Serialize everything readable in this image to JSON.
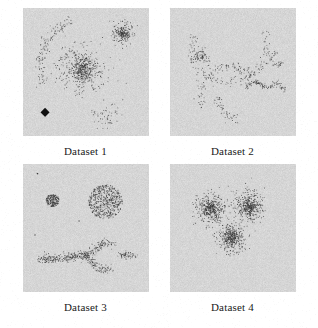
{
  "figure": {
    "title": "",
    "background_color": "#ffffff",
    "panel_background_color": "#d9d9d9",
    "point_color": "#3a3a3a",
    "caption_color": "#1a1a1a",
    "panel_width_px": 126,
    "panel_height_px": 128,
    "columns": 2,
    "rows": 2
  },
  "panels": [
    {
      "id": "dataset-1",
      "caption": "Dataset 1"
    },
    {
      "id": "dataset-2",
      "caption": "Dataset 2"
    },
    {
      "id": "dataset-3",
      "caption": "Dataset 3"
    },
    {
      "id": "dataset-4",
      "caption": "Dataset 4"
    }
  ],
  "chart_data": [
    {
      "type": "scatter",
      "title": "Dataset 1",
      "xlabel": "",
      "ylabel": "",
      "xlim": [
        0,
        1
      ],
      "ylim": [
        0,
        1
      ],
      "grid": false,
      "legend": false,
      "axes_visible": false,
      "marker": "point",
      "marker_size_px": 1.4,
      "background": "#d9d9d9",
      "description": "Dense central Gaussian blob, small dense blob upper-right, sparse scattered blob lower-right, thin crescent arc on the left, and one large solid black diamond marker at lower-left.",
      "clusters": [
        {
          "name": "central-dense-blob",
          "shape": "gaussian",
          "cx": 0.47,
          "cy": 0.52,
          "sx": 0.085,
          "sy": 0.085,
          "n": 420,
          "core_n": 140,
          "core_scale": 0.38
        },
        {
          "name": "upper-right-blob",
          "shape": "gaussian",
          "cx": 0.79,
          "cy": 0.8,
          "sx": 0.042,
          "sy": 0.04,
          "n": 170,
          "core_n": 60,
          "core_scale": 0.45
        },
        {
          "name": "lower-right-sparse-blob",
          "shape": "gaussian",
          "cx": 0.66,
          "cy": 0.17,
          "sx": 0.055,
          "sy": 0.05,
          "n": 55,
          "core_n": 0,
          "core_scale": 1
        },
        {
          "name": "left-crescent-arc",
          "shape": "arc",
          "cx": 0.5,
          "cy": 0.55,
          "r": 0.36,
          "a0": 108,
          "a1": 205,
          "thickness": 0.022,
          "n": 130
        }
      ],
      "markers": [
        {
          "name": "black-diamond",
          "shape": "diamond",
          "x": 0.175,
          "y": 0.185,
          "size": 0.072,
          "color": "#111111"
        }
      ]
    },
    {
      "type": "scatter",
      "title": "Dataset 2",
      "xlabel": "",
      "ylabel": "",
      "xlim": [
        0,
        1
      ],
      "ylim": [
        0,
        1
      ],
      "grid": false,
      "legend": false,
      "axes_visible": false,
      "marker": "point",
      "marker_size_px": 1.4,
      "background": "#d9d9d9",
      "description": "Curvilinear structures: a long S-shaped / spiral filament sweeping from upper-left down to lower-middle, a small tight spiral blob on the left, and a short zigzag filament with a detached hook on the right.",
      "clusters": [
        {
          "name": "main-spiral-upper-arc",
          "shape": "arc",
          "cx": 0.47,
          "cy": 0.72,
          "r": 0.3,
          "a0": 160,
          "a1": 380,
          "thickness": 0.022,
          "n": 150
        },
        {
          "name": "main-spiral-lower-sweep",
          "shape": "arc",
          "cx": 0.46,
          "cy": 0.33,
          "r": 0.22,
          "a0": 35,
          "a1": 215,
          "thickness": 0.022,
          "n": 110
        },
        {
          "name": "lower-tail",
          "shape": "arc",
          "cx": 0.6,
          "cy": 0.33,
          "r": 0.22,
          "a0": 185,
          "a1": 255,
          "thickness": 0.022,
          "n": 45
        },
        {
          "name": "small-spiral-blob",
          "shape": "spiral",
          "cx": 0.255,
          "cy": 0.615,
          "r0": 0.012,
          "r1": 0.055,
          "turns": 1.6,
          "thickness": 0.016,
          "n": 70
        },
        {
          "name": "right-zigzag",
          "shape": "polyline",
          "thickness": 0.018,
          "n": 110,
          "points": [
            [
              0.595,
              0.385
            ],
            [
              0.69,
              0.425
            ],
            [
              0.775,
              0.375
            ],
            [
              0.855,
              0.415
            ],
            [
              0.915,
              0.36
            ]
          ]
        },
        {
          "name": "right-hook",
          "shape": "polyline",
          "thickness": 0.016,
          "n": 35,
          "points": [
            [
              0.845,
              0.66
            ],
            [
              0.8,
              0.6
            ],
            [
              0.84,
              0.545
            ],
            [
              0.895,
              0.575
            ]
          ]
        }
      ],
      "markers": []
    },
    {
      "type": "scatter",
      "title": "Dataset 3",
      "xlabel": "",
      "ylabel": "",
      "xlim": [
        0,
        1
      ],
      "ylim": [
        0,
        1
      ],
      "grid": false,
      "legend": false,
      "axes_visible": false,
      "marker": "point",
      "marker_size_px": 1.4,
      "background": "#d9d9d9",
      "description": "Small very dense round cluster on the left, large evenly-filled uniform disk on the upper right, and a thick Y / arrow-shaped band across the lower half with a detached short bar to its right. Two isolated stray points near the top-left.",
      "clusters": [
        {
          "name": "small-dense-blob",
          "shape": "uniform-disk",
          "cx": 0.235,
          "cy": 0.715,
          "r": 0.052,
          "n": 200
        },
        {
          "name": "large-uniform-disk",
          "shape": "uniform-disk",
          "cx": 0.655,
          "cy": 0.705,
          "r": 0.135,
          "n": 520
        },
        {
          "name": "y-shape-stem",
          "shape": "polyline",
          "thickness": 0.03,
          "n": 240,
          "points": [
            [
              0.135,
              0.255
            ],
            [
              0.5,
              0.285
            ]
          ]
        },
        {
          "name": "y-shape-upper-branch",
          "shape": "polyline",
          "thickness": 0.028,
          "n": 110,
          "points": [
            [
              0.5,
              0.285
            ],
            [
              0.645,
              0.385
            ],
            [
              0.72,
              0.375
            ]
          ]
        },
        {
          "name": "y-shape-lower-branch",
          "shape": "polyline",
          "thickness": 0.028,
          "n": 110,
          "points": [
            [
              0.5,
              0.285
            ],
            [
              0.6,
              0.175
            ],
            [
              0.71,
              0.185
            ]
          ]
        },
        {
          "name": "detached-right-bar",
          "shape": "polyline",
          "thickness": 0.026,
          "n": 60,
          "points": [
            [
              0.775,
              0.285
            ],
            [
              0.885,
              0.285
            ]
          ]
        }
      ],
      "markers": [
        {
          "name": "stray-point-a",
          "shape": "dot",
          "x": 0.115,
          "y": 0.925,
          "size": 0.012,
          "color": "#3a3a3a"
        },
        {
          "name": "stray-point-b",
          "shape": "dot",
          "x": 0.445,
          "y": 0.555,
          "size": 0.01,
          "color": "#3a3a3a"
        },
        {
          "name": "stray-point-c",
          "shape": "dot",
          "x": 0.095,
          "y": 0.445,
          "size": 0.01,
          "color": "#3a3a3a"
        }
      ],
      "markers_note": ""
    },
    {
      "type": "scatter",
      "title": "Dataset 4",
      "xlabel": "",
      "ylabel": "",
      "xlim": [
        0,
        1
      ],
      "ylim": [
        0,
        1
      ],
      "grid": false,
      "legend": false,
      "axes_visible": false,
      "marker": "point",
      "marker_size_px": 1.4,
      "background": "#d9d9d9",
      "description": "Three overlapping Gaussian clusters of similar size arranged in a triangle: two side by side in the upper half and one below centred between them, each with a dark dense core fading outward.",
      "clusters": [
        {
          "name": "left-gaussian",
          "shape": "gaussian",
          "cx": 0.325,
          "cy": 0.655,
          "sx": 0.06,
          "sy": 0.06,
          "n": 330,
          "core_n": 120,
          "core_scale": 0.45
        },
        {
          "name": "right-gaussian",
          "shape": "gaussian",
          "cx": 0.625,
          "cy": 0.665,
          "sx": 0.06,
          "sy": 0.06,
          "n": 330,
          "core_n": 120,
          "core_scale": 0.45
        },
        {
          "name": "bottom-gaussian",
          "shape": "gaussian",
          "cx": 0.485,
          "cy": 0.425,
          "sx": 0.058,
          "sy": 0.058,
          "n": 320,
          "core_n": 115,
          "core_scale": 0.45
        }
      ],
      "markers": []
    }
  ]
}
